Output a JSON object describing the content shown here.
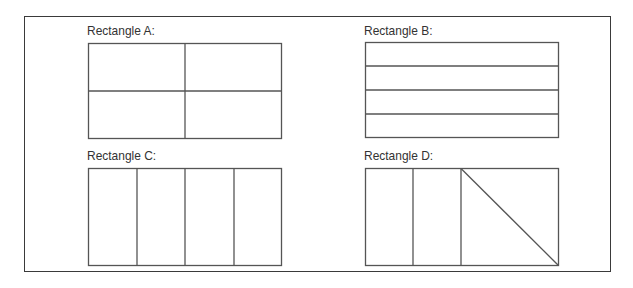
{
  "figure": {
    "rectangles": [
      {
        "id": "A",
        "label": "Rectangle A:",
        "division": "2x2 grid (four equal parts)"
      },
      {
        "id": "B",
        "label": "Rectangle B:",
        "division": "4 horizontal strips"
      },
      {
        "id": "C",
        "label": "Rectangle C:",
        "division": "4 vertical strips"
      },
      {
        "id": "D",
        "label": "Rectangle D:",
        "division": "2 vertical strips + half split by diagonal"
      }
    ],
    "colors": {
      "stroke": "#555555",
      "frame": "#3a3a3a",
      "text": "#333333"
    }
  }
}
